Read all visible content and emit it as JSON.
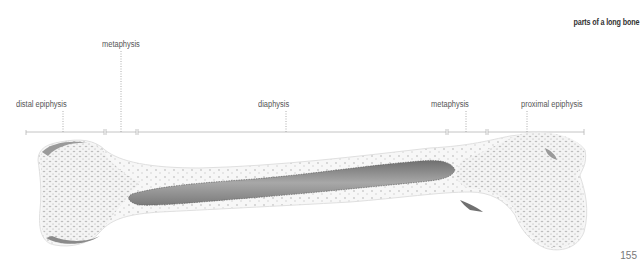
{
  "title": "parts of a long bone",
  "page_number": "155",
  "labels": [
    {
      "id": "distal-epiphysis",
      "text": "distal epiphysis",
      "x": 16,
      "y": 99
    },
    {
      "id": "metaphysis-left",
      "text": "metaphysis",
      "x": 102,
      "y": 39
    },
    {
      "id": "diaphysis",
      "text": "diaphysis",
      "x": 258,
      "y": 99
    },
    {
      "id": "metaphysis-right",
      "text": "metaphysis",
      "x": 431,
      "y": 99
    },
    {
      "id": "proximal-epiphysis",
      "text": "proximal epiphysis",
      "x": 521,
      "y": 99
    }
  ],
  "brackets": [
    {
      "name": "distal-epiphysis",
      "x1": 26,
      "x2": 104,
      "leader_x": 63
    },
    {
      "name": "metaphysis-left",
      "x1": 106,
      "x2": 136,
      "leader_x": 121
    },
    {
      "name": "diaphysis",
      "x1": 138,
      "x2": 446,
      "leader_x": 286
    },
    {
      "name": "metaphysis-right",
      "x1": 448,
      "x2": 486,
      "leader_x": 466
    },
    {
      "name": "proximal-epiphysis",
      "x1": 488,
      "x2": 584,
      "leader_x": 527
    }
  ],
  "colors": {
    "line": "#b5b5b5",
    "bone_fill": "#f3f3f3",
    "spongy_dots": "#bdbdbd",
    "marrow": "#8c8c8c",
    "cortex_shadow": "#9a9a9a"
  }
}
